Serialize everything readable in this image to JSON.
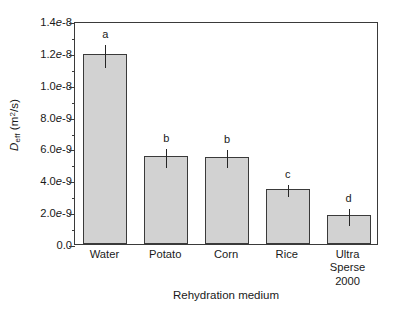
{
  "chart_data": {
    "type": "bar",
    "title": "",
    "xlabel": "Rehydration medium",
    "ylabel": "Deff (m2/s)",
    "ylabel_parts": {
      "symbol": "D",
      "subscript": "eff",
      "units_open": " (m",
      "units_sup": "2",
      "units_close": "/s)"
    },
    "categories": [
      "Water",
      "Potato",
      "Corn",
      "Rice",
      "Ultra Sperse 2000"
    ],
    "category_lines": [
      [
        "Water"
      ],
      [
        "Potato"
      ],
      [
        "Corn"
      ],
      [
        "Rice"
      ],
      [
        "Ultra",
        "Sperse",
        "2000"
      ]
    ],
    "values": [
      1.19e-08,
      5.5e-09,
      5.45e-09,
      3.45e-09,
      1.8e-09
    ],
    "errors": [
      7e-10,
      6e-10,
      5.5e-10,
      3.5e-10,
      5.5e-10
    ],
    "annotations": [
      "a",
      "b",
      "b",
      "c",
      "d"
    ],
    "ylim": [
      0,
      1.4e-08
    ],
    "ytick_values": [
      0,
      2e-09,
      4e-09,
      6e-09,
      8e-09,
      1e-08,
      1.2e-08,
      1.4e-08
    ],
    "ytick_labels": [
      "0.0",
      "2.0e-9",
      "4.0e-9",
      "6.0e-9",
      "8.0e-9",
      "1.0e-8",
      "1.2e-8",
      "1.4e-8"
    ],
    "yminor_values": [
      1e-09,
      3e-09,
      5e-09,
      7e-09,
      9e-09,
      1.1e-08,
      1.3e-08
    ],
    "grid": false,
    "legend": null,
    "bar_color": "#d2d2d2",
    "bar_edge_color": "#3a3a3a",
    "error_color": "#262626",
    "frame_color": "#3a3a3a"
  }
}
